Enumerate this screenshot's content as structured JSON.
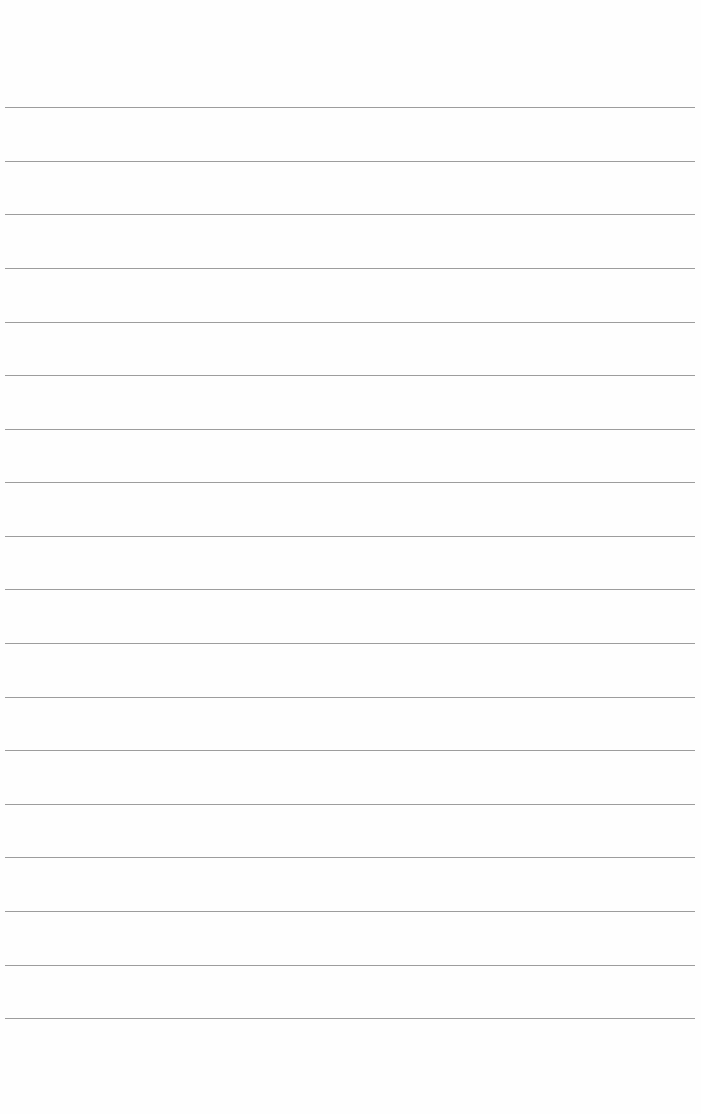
{
  "page": {
    "type": "lined-paper",
    "background_color": "#fefefe",
    "rule_color": "#8c8c8c",
    "rule_count": 18,
    "rule_left": 5,
    "rule_width": 690,
    "rule_y_positions": [
      107,
      161,
      214,
      268,
      322,
      375,
      429,
      482,
      536,
      589,
      643,
      697,
      750,
      804,
      857,
      911,
      965,
      1018
    ],
    "text_content": []
  }
}
